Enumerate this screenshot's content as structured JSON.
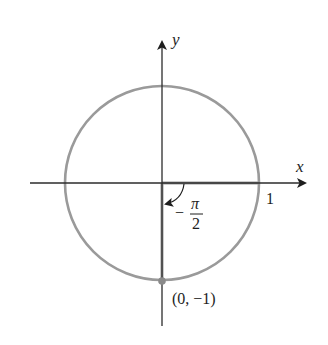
{
  "diagram": {
    "type": "unit-circle",
    "axes": {
      "x_label": "x",
      "y_label": "y"
    },
    "labels": {
      "one": "1",
      "angle_sign": "−",
      "angle_numerator": "π",
      "angle_denominator": "2",
      "point": "(0, −1)"
    },
    "angle": {
      "value": "-π/2",
      "direction": "clockwise"
    },
    "terminal_point": {
      "x": 0,
      "y": -1
    },
    "colors": {
      "axis": "#2b2b2b",
      "circle": "#9a9a9a",
      "terminal_ray": "#9a9a9a",
      "point": "#8a8a8a",
      "text": "#1e1e1e"
    }
  }
}
